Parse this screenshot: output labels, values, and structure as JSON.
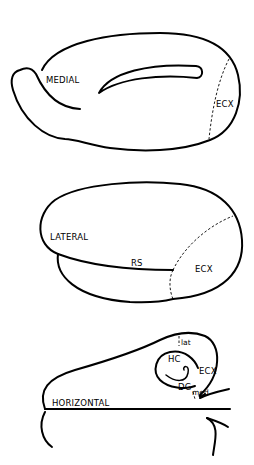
{
  "panels": [
    {
      "id": "medial",
      "view_label": "MEDIAL",
      "region_labels": [
        "ECX"
      ]
    },
    {
      "id": "lateral",
      "view_label": "LATERAL",
      "region_labels": [
        "RS",
        "ECX"
      ]
    },
    {
      "id": "horizontal",
      "view_label": "HORIZONTAL",
      "region_labels": [
        "HC",
        "ECX",
        "DG",
        "lat",
        "med"
      ]
    }
  ],
  "labels": {
    "medial": "MEDIAL",
    "medial_ecx": "ECX",
    "lateral": "LATERAL",
    "lateral_rs": "RS",
    "lateral_ecx": "ECX",
    "horizontal": "HORIZONTAL",
    "horizontal_hc": "HC",
    "horizontal_ecx": "ECX",
    "horizontal_dg": "DG",
    "horizontal_lat": "lat",
    "horizontal_med": "med"
  }
}
